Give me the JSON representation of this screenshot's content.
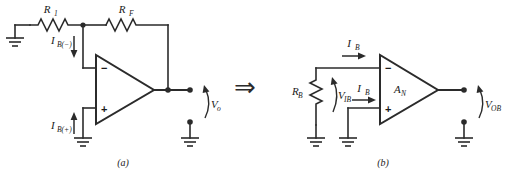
{
  "figure": {
    "type": "circuit-diagram",
    "panels": [
      {
        "id": "a",
        "caption": "(a)",
        "labels": {
          "r1": "R",
          "r1_sub": "1",
          "rf": "R",
          "rf_sub": "F",
          "ib_minus": "I",
          "ib_minus_sub": "B(−)",
          "ib_plus": "I",
          "ib_plus_sub": "B(+)",
          "vo": "V",
          "vo_sub": "o",
          "inverting_sign": "−",
          "noninverting_sign": "+"
        }
      },
      {
        "id": "b",
        "caption": "(b)",
        "labels": {
          "rb": "R",
          "rb_sub": "B",
          "vib": "V",
          "vib_sub": "IB",
          "ib_top": "I",
          "ib_top_sub": "B",
          "ib_bottom": "I",
          "ib_bottom_sub": "B",
          "gain": "A",
          "gain_sub": "N",
          "vob": "V",
          "vob_sub": "OB",
          "inverting_sign": "−",
          "noninverting_sign": "+"
        }
      }
    ],
    "connector": {
      "symbol": "⇒",
      "name": "implies-arrow"
    },
    "colors": {
      "line": "#2b2b2b",
      "text": "#1a1a1a",
      "background": "#ffffff"
    }
  }
}
